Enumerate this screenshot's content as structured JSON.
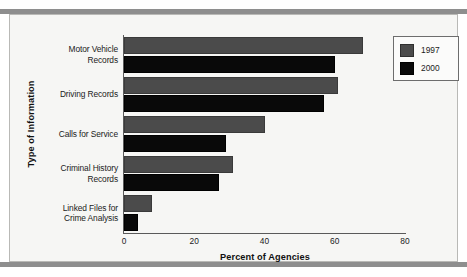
{
  "chart_data": {
    "type": "bar",
    "orientation": "horizontal",
    "title": "",
    "xlabel": "Percent of Agencies",
    "ylabel": "Type of Information",
    "xlim": [
      0,
      80
    ],
    "xticks": [
      0,
      20,
      40,
      60,
      80
    ],
    "grid": false,
    "legend_position": "top-right",
    "categories": [
      "Motor Vehicle Records",
      "Driving Records",
      "Calls for Service",
      "Criminal History Records",
      "Linked Files for Crime Analysis"
    ],
    "category_lines": [
      [
        "Motor Vehicle",
        "Records"
      ],
      [
        "Driving Records"
      ],
      [
        "Calls for Service"
      ],
      [
        "Criminal History",
        "Records"
      ],
      [
        "Linked Files for",
        "Crime Analysis"
      ]
    ],
    "series": [
      {
        "name": "1997",
        "color": "#4b4b4b",
        "values": [
          68,
          61,
          40,
          31,
          8
        ]
      },
      {
        "name": "2000",
        "color": "#090909",
        "values": [
          60,
          57,
          29,
          27,
          4
        ]
      }
    ]
  },
  "legend": {
    "entries": [
      {
        "label": "1997",
        "swatch": "#4b4b4b"
      },
      {
        "label": "2000",
        "swatch": "#090909"
      }
    ]
  },
  "axes": {
    "x_title": "Percent of Agencies",
    "y_title": "Type of Information",
    "x_tick_labels": [
      "0",
      "20",
      "40",
      "60",
      "80"
    ]
  }
}
